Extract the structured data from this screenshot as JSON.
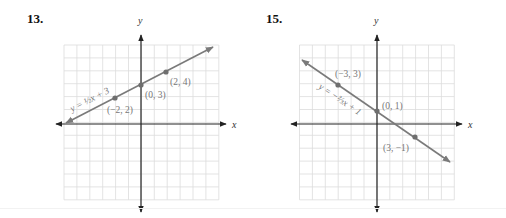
{
  "problems": [
    {
      "number": "13.",
      "equation_label": "y = ½x + 3",
      "x_axis_label": "x",
      "y_axis_label": "y",
      "points": [
        {
          "label": "(−2, 2)",
          "x": -2,
          "y": 2
        },
        {
          "label": "(0, 3)",
          "x": 0,
          "y": 3
        },
        {
          "label": "(2, 4)",
          "x": 2,
          "y": 4
        }
      ]
    },
    {
      "number": "15.",
      "equation_label": "y = −⅔x + 1",
      "x_axis_label": "x",
      "y_axis_label": "y",
      "points": [
        {
          "label": "(−3, 3)",
          "x": -3,
          "y": 3
        },
        {
          "label": "(0, 1)",
          "x": 0,
          "y": 1
        },
        {
          "label": "(3, −1)",
          "x": 3,
          "y": -1
        }
      ]
    }
  ],
  "colors": {
    "line": "#7a7a7a",
    "point": "#6e6e6e",
    "axis": "#222222",
    "grid": "#dcdcdc",
    "label": "#777777"
  },
  "chart_data": [
    {
      "type": "line",
      "title": "13.",
      "xlabel": "x",
      "ylabel": "y",
      "xlim": [
        -6,
        6
      ],
      "ylim": [
        -6,
        6
      ],
      "grid": true,
      "series": [
        {
          "name": "y = 1/2 x + 3",
          "slope": 0.5,
          "intercept": 3,
          "x": [
            -2,
            0,
            2
          ],
          "y": [
            2,
            3,
            4
          ]
        }
      ],
      "annotations": [
        "(−2, 2)",
        "(0, 3)",
        "(2, 4)",
        "y = ½x + 3"
      ]
    },
    {
      "type": "line",
      "title": "15.",
      "xlabel": "x",
      "ylabel": "y",
      "xlim": [
        -6,
        6
      ],
      "ylim": [
        -6,
        6
      ],
      "grid": true,
      "series": [
        {
          "name": "y = -2/3 x + 1",
          "slope": -0.6667,
          "intercept": 1,
          "x": [
            -3,
            0,
            3
          ],
          "y": [
            3,
            1,
            -1
          ]
        }
      ],
      "annotations": [
        "(−3, 3)",
        "(0, 1)",
        "(3, −1)",
        "y = −⅔x + 1"
      ]
    }
  ]
}
